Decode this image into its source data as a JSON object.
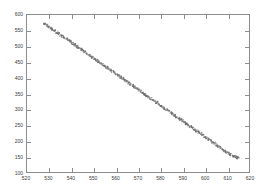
{
  "chart_data": {
    "type": "scatter",
    "title": "",
    "subtitle": "",
    "xlabel": "",
    "ylabel": "",
    "grid": false,
    "legend": null,
    "xlim": [
      520,
      620
    ],
    "ylim": [
      100,
      600
    ],
    "xticks": [
      520,
      530,
      540,
      550,
      560,
      570,
      580,
      590,
      600,
      610,
      620
    ],
    "yticks": [
      100,
      150,
      200,
      250,
      300,
      350,
      400,
      450,
      500,
      550,
      600
    ],
    "series": [
      {
        "name": "data",
        "color": "#6e6e6e",
        "marker": "dot",
        "x": [
          528.0,
          528.9,
          529.8,
          530.7,
          531.6,
          532.5,
          533.4,
          534.3,
          535.2,
          536.1,
          537.0,
          537.9,
          538.8,
          539.7,
          540.6,
          541.5,
          542.4,
          543.3,
          544.2,
          545.1,
          546.0,
          546.9,
          547.8,
          548.7,
          549.6,
          550.5,
          551.4,
          552.3,
          553.2,
          554.1,
          555.0,
          555.9,
          556.8,
          557.7,
          558.6,
          559.5,
          560.4,
          561.3,
          562.2,
          563.1,
          564.0,
          564.9,
          565.8,
          566.7,
          567.6,
          568.5,
          569.4,
          570.3,
          571.2,
          572.1,
          573.0,
          573.9,
          574.8,
          575.7,
          576.6,
          577.5,
          578.4,
          579.3,
          580.2,
          581.1,
          582.0,
          582.9,
          583.8,
          584.7,
          585.6,
          586.5,
          587.4,
          588.3,
          589.2,
          590.1,
          591.0,
          591.9,
          592.8,
          593.7,
          594.6,
          595.5,
          596.4,
          597.3,
          598.2,
          599.1,
          600.0,
          600.9,
          601.8,
          602.7,
          603.6,
          604.5,
          605.4,
          606.3,
          607.2,
          608.1,
          609.0,
          609.9,
          610.8,
          611.7,
          612.6,
          613.5,
          614.4,
          615.0
        ],
        "y": [
          572.0,
          567.6,
          563.0,
          558.9,
          554.0,
          549.8,
          545.1,
          540.7,
          536.2,
          531.8,
          527.1,
          522.9,
          518.2,
          513.8,
          509.3,
          504.9,
          500.2,
          496.0,
          491.3,
          486.9,
          482.4,
          478.0,
          473.3,
          469.1,
          464.4,
          460.0,
          455.5,
          451.1,
          446.4,
          442.2,
          437.5,
          433.1,
          428.6,
          424.2,
          419.5,
          415.3,
          410.6,
          406.2,
          401.7,
          397.3,
          392.6,
          388.4,
          383.7,
          379.3,
          374.8,
          370.4,
          365.7,
          361.5,
          356.8,
          352.4,
          347.9,
          343.5,
          338.8,
          334.6,
          329.9,
          325.5,
          321.0,
          316.6,
          311.9,
          307.7,
          303.0,
          298.6,
          294.1,
          289.7,
          285.0,
          280.8,
          276.1,
          271.7,
          267.2,
          262.8,
          258.1,
          253.9,
          249.2,
          244.8,
          240.3,
          235.9,
          231.2,
          227.0,
          222.3,
          217.9,
          213.4,
          209.0,
          204.3,
          200.1,
          195.4,
          191.0,
          186.5,
          182.1,
          177.4,
          173.2,
          168.5,
          164.1,
          159.6,
          155.2,
          150.5,
          148.8,
          147.2,
          146.0
        ]
      }
    ]
  }
}
